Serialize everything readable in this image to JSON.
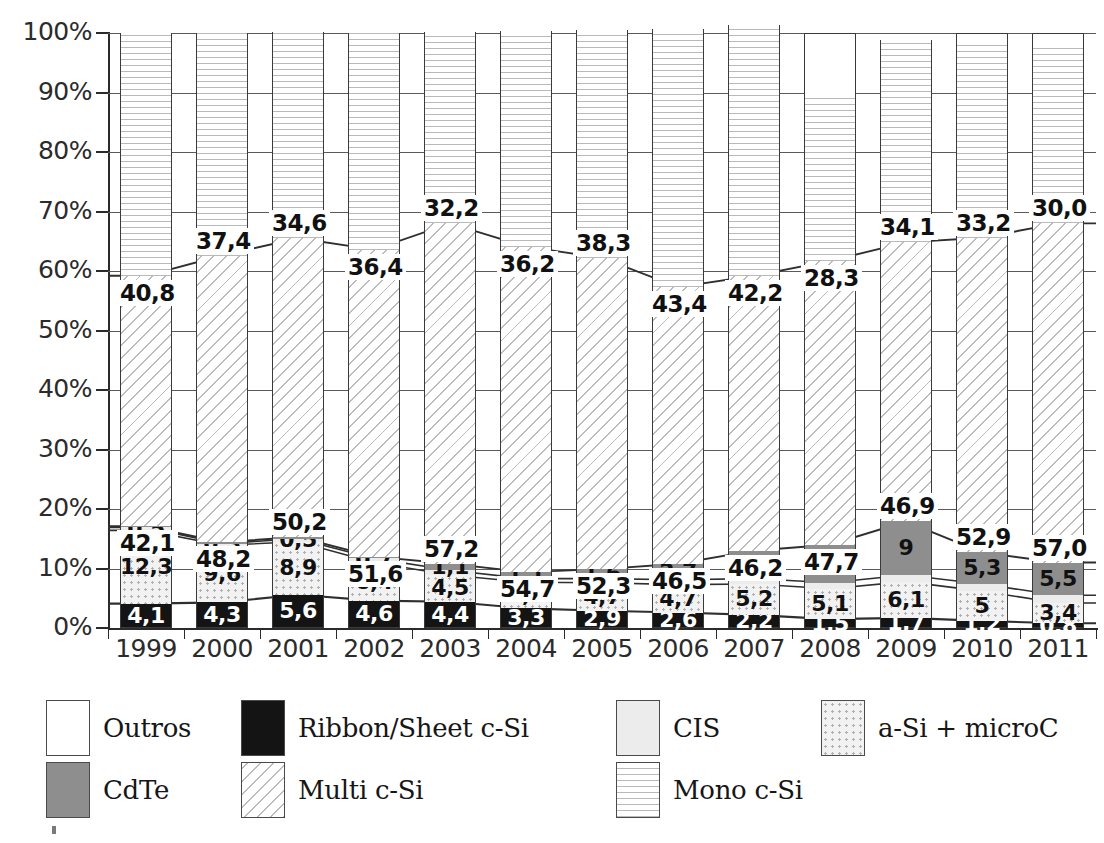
{
  "chart_data": {
    "type": "bar",
    "subtype": "stacked-percentage-bar-with-lines",
    "title": "",
    "xlabel": "",
    "ylabel": "",
    "ylim": [
      0,
      100
    ],
    "ytick_labels": [
      "0%",
      "10%",
      "20%",
      "30%",
      "40%",
      "50%",
      "60%",
      "70%",
      "80%",
      "90%",
      "100%"
    ],
    "ytick_values": [
      0,
      10,
      20,
      30,
      40,
      50,
      60,
      70,
      80,
      90,
      100
    ],
    "grid": true,
    "legend_position": "bottom",
    "categories": [
      "1999",
      "2000",
      "2001",
      "2002",
      "2003",
      "2004",
      "2005",
      "2006",
      "2007",
      "2008",
      "2009",
      "2010",
      "2011"
    ],
    "stack_order_bottom_to_top": [
      "Ribbon/Sheet c-Si",
      "a-Si + microC",
      "CIS",
      "CdTe",
      "Multi c-Si",
      "Mono c-Si",
      "Outros"
    ],
    "series": [
      {
        "name": "Ribbon/Sheet c-Si",
        "pattern": "solid-black",
        "color": "#141414",
        "values": [
          4.1,
          4.3,
          5.6,
          4.6,
          4.4,
          3.3,
          2.9,
          2.6,
          2.2,
          1.5,
          1.7,
          1.2,
          0.8
        ],
        "labels": [
          "4,1",
          "4,3",
          "5,6",
          "4,6",
          "4,4",
          "3,3",
          "2,9",
          "2,6",
          "2,2",
          "1,5",
          "1,7",
          "1,2",
          "0,8"
        ]
      },
      {
        "name": "a-Si + microC",
        "pattern": "dotted",
        "color": "#f2f2f2",
        "values": [
          12.3,
          9.6,
          8.9,
          6.4,
          4.5,
          4.4,
          4.7,
          4.7,
          5.2,
          5.1,
          6.1,
          5.0,
          3.4
        ],
        "labels": [
          "12,3",
          "9,6",
          "8,9",
          "6,4",
          "4,5",
          "4,4",
          "4,7",
          "4,7",
          "5,2",
          "5,1",
          "6,1",
          "5",
          "3,4"
        ]
      },
      {
        "name": "CIS",
        "pattern": "light-solid",
        "color": "#ececec",
        "values": [
          0.5,
          0.3,
          0.5,
          0.7,
          0.8,
          0.6,
          0.7,
          0.8,
          0.9,
          1.0,
          1.1,
          1.2,
          1.3
        ],
        "labels": [
          "0,5",
          "0,3",
          "0,5",
          "0,7",
          "",
          "",
          "",
          "",
          "",
          "",
          "",
          "",
          ""
        ]
      },
      {
        "name": "CdTe",
        "pattern": "mid-gray",
        "color": "#8e8e8e",
        "values": [
          0.2,
          0.2,
          0.3,
          0.3,
          1.1,
          1.1,
          1.6,
          2.7,
          4.7,
          6.4,
          9.0,
          5.3,
          5.5
        ],
        "labels": [
          "",
          "",
          "",
          "",
          "1,1",
          "1,1",
          "1,6",
          "2,7",
          "4,7",
          "6,4",
          "9",
          "5,3",
          "5,5"
        ]
      },
      {
        "name": "Multi c-Si",
        "pattern": "diagonal-hatch",
        "color": "#fefefe",
        "values": [
          42.1,
          48.2,
          50.2,
          51.6,
          57.2,
          54.7,
          52.3,
          46.5,
          46.2,
          47.7,
          46.9,
          52.9,
          57.0
        ],
        "labels": [
          "42,1",
          "48,2",
          "50,2",
          "51,6",
          "57,2",
          "54,7",
          "52,3",
          "46,5",
          "46,2",
          "47,7",
          "46,9",
          "52,9",
          "57,0"
        ]
      },
      {
        "name": "Mono c-Si",
        "pattern": "horizontal-lines",
        "color": "#fdfdfd",
        "values": [
          40.8,
          37.4,
          34.6,
          36.4,
          32.2,
          36.2,
          38.3,
          43.4,
          42.2,
          28.3,
          34.1,
          33.2,
          30.0
        ],
        "labels": [
          "40,8",
          "37,4",
          "34,6",
          "36,4",
          "32,2",
          "36,2",
          "38,3",
          "43,4",
          "42,2",
          "28,3",
          "34,1",
          "33,2",
          "30,0"
        ]
      },
      {
        "name": "Outros",
        "pattern": "white",
        "color": "#ffffff",
        "values": [
          0.0,
          0.0,
          0.0,
          0.0,
          0.0,
          0.0,
          0.0,
          0.0,
          0.0,
          10.0,
          0.0,
          1.2,
          2.0
        ],
        "labels": [
          "",
          "",
          "",
          "",
          "",
          "",
          "",
          "",
          "",
          "",
          "",
          "",
          ""
        ]
      }
    ]
  },
  "legend": {
    "rows": [
      [
        {
          "label": "Outros",
          "swatch": "white",
          "name": "outros"
        },
        {
          "label": "Ribbon/Sheet c-Si",
          "swatch": "ribbon",
          "name": "ribbon-sheet-c-si"
        },
        {
          "label": "CIS",
          "swatch": "cis",
          "name": "cis"
        },
        {
          "label": "a-Si + microC",
          "swatch": "asi",
          "name": "a-si-microc"
        }
      ],
      [
        {
          "label": "CdTe",
          "swatch": "cdte",
          "name": "cdte"
        },
        {
          "label": "Multi c-Si",
          "swatch": "multi",
          "name": "multi-c-si"
        },
        {
          "label": "Mono c-Si",
          "swatch": "mono",
          "name": "mono-c-si"
        }
      ]
    ]
  }
}
